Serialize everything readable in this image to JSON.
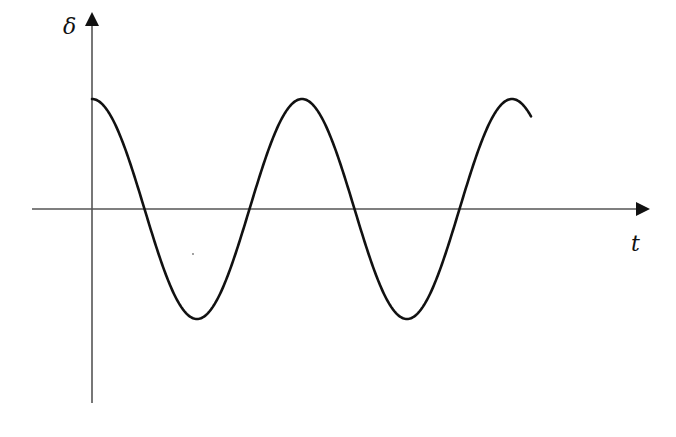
{
  "chart_data": {
    "type": "line",
    "title": "",
    "xlabel": "t",
    "ylabel": "δ",
    "function": "cosine oscillation (undamped)",
    "series": [
      {
        "name": "δ(t)",
        "description": "Starts at positive maximum at t=0, oscillates with constant amplitude",
        "x": [
          0,
          0.25,
          0.5,
          0.75,
          1.0,
          1.25,
          1.5,
          1.75,
          2.0,
          2.1
        ],
        "values": [
          1,
          0,
          -1,
          0,
          1,
          0,
          -1,
          0,
          1,
          0.72
        ]
      }
    ],
    "annotations": {
      "peaks": 3,
      "troughs": 2
    },
    "grid": false,
    "legend": null
  },
  "axes": {
    "x_label": "t",
    "y_label": "δ"
  },
  "colors": {
    "curve": "#111111",
    "axis": "#555555",
    "background": "#ffffff"
  }
}
